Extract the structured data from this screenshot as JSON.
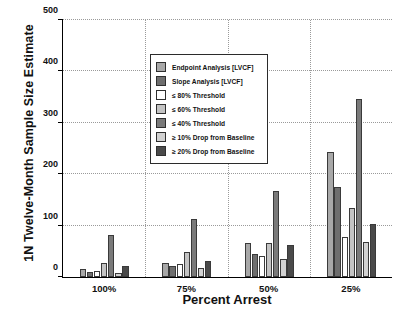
{
  "chart_data": {
    "type": "bar",
    "title": "",
    "xlabel": "Percent Arrest",
    "ylabel": "1N Twelve-Month Sample Size Estimate",
    "categories": [
      "100%",
      "75%",
      "50%",
      "25%"
    ],
    "ylim": [
      0,
      500
    ],
    "yticks": [
      0,
      100,
      200,
      300,
      400,
      500
    ],
    "grid": true,
    "legend_position": "upper-left-inside",
    "series": [
      {
        "name": "Endpoint Analysis [LVCF]",
        "color": "#a8a8a8",
        "values": [
          15,
          28,
          65,
          243
        ]
      },
      {
        "name": "Slope Analysis [LVCF]",
        "color": "#6e6e6e",
        "values": [
          10,
          22,
          45,
          175
        ]
      },
      {
        "name": "≤ 80% Threshold",
        "color": "#ffffff",
        "values": [
          12,
          25,
          40,
          78
        ]
      },
      {
        "name": "≤ 60% Threshold",
        "color": "#c4c4c4",
        "values": [
          28,
          48,
          65,
          133
        ]
      },
      {
        "name": "≤ 40% Threshold",
        "color": "#7a7a7a",
        "values": [
          82,
          112,
          167,
          345
        ]
      },
      {
        "name": "≥ 10% Drop from Baseline",
        "color": "#d2d2d2",
        "values": [
          8,
          18,
          35,
          68
        ]
      },
      {
        "name": "≥ 20% Drop from Baseline",
        "color": "#4a4a4a",
        "values": [
          22,
          32,
          62,
          103
        ]
      }
    ]
  },
  "axis": {
    "y_tick_labels": [
      "0",
      "100",
      "200",
      "300",
      "400",
      "500"
    ],
    "x_tick_labels": [
      "100%",
      "75%",
      "50%",
      "25%"
    ],
    "x_title": "Percent Arrest",
    "y_title": "1N Twelve-Month Sample Size Estimate"
  },
  "legend": {
    "items": [
      {
        "label": "Endpoint Analysis [LVCF]",
        "color": "#a8a8a8"
      },
      {
        "label": "Slope Analysis [LVCF]",
        "color": "#6e6e6e"
      },
      {
        "label": "≤ 80% Threshold",
        "color": "#ffffff"
      },
      {
        "label": "≤ 60% Threshold",
        "color": "#c4c4c4"
      },
      {
        "label": "≤ 40% Threshold",
        "color": "#7a7a7a"
      },
      {
        "label": "≥ 10% Drop from Baseline",
        "color": "#d2d2d2"
      },
      {
        "label": "≥ 20% Drop from Baseline",
        "color": "#4a4a4a"
      }
    ]
  }
}
